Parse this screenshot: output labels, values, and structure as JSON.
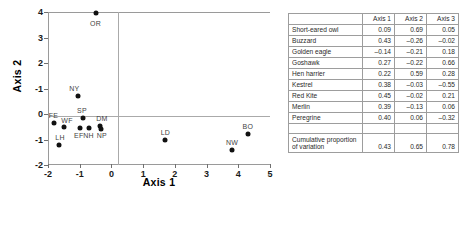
{
  "chart_data": {
    "type": "scatter",
    "title": "",
    "xlabel": "Axis 1",
    "ylabel": "Axis 2",
    "xlim": [
      -2,
      5
    ],
    "ylim": [
      -2,
      4
    ],
    "xticks": [
      "-2",
      "-1",
      "0",
      "1",
      "2",
      "3",
      "4",
      "5"
    ],
    "xtick_values": [
      -2,
      -1,
      0,
      1,
      2,
      3,
      4,
      5
    ],
    "yticks": [
      "4",
      "3",
      "2",
      "-1",
      "0",
      "-1",
      "-2"
    ],
    "ytick_values": [
      4,
      3,
      2,
      1,
      0,
      -1,
      -2
    ],
    "grid": false,
    "legend": "none",
    "points": [
      {
        "label": "OR",
        "x": -0.5,
        "y": 3.95,
        "lx": -0.5,
        "ly": 3.55
      },
      {
        "label": "NY",
        "x": -1.05,
        "y": 0.7,
        "lx": -1.17,
        "ly": 1.02
      },
      {
        "label": "SP",
        "x": -0.9,
        "y": -0.15,
        "lx": -0.93,
        "ly": 0.16
      },
      {
        "label": "FE",
        "x": -1.8,
        "y": -0.35,
        "lx": -1.83,
        "ly": -0.03
      },
      {
        "label": "WF",
        "x": -1.5,
        "y": -0.52,
        "lx": -1.4,
        "ly": -0.25
      },
      {
        "label": "EF",
        "x": -1.0,
        "y": -0.55,
        "lx": -1.03,
        "ly": -0.82
      },
      {
        "label": "NH",
        "x": -0.72,
        "y": -0.55,
        "lx": -0.72,
        "ly": -0.82
      },
      {
        "label": "DM",
        "x": -0.35,
        "y": -0.47,
        "lx": -0.3,
        "ly": -0.16
      },
      {
        "label": "NP",
        "x": -0.33,
        "y": -0.57,
        "lx": -0.3,
        "ly": -0.84
      },
      {
        "label": "LH",
        "x": -1.65,
        "y": -1.2,
        "lx": -1.62,
        "ly": -0.92
      },
      {
        "label": "LD",
        "x": 1.7,
        "y": -1.02,
        "lx": 1.7,
        "ly": -0.72
      },
      {
        "label": "NW",
        "x": 3.8,
        "y": -1.4,
        "lx": 3.8,
        "ly": -1.1
      },
      {
        "label": "BO",
        "x": 4.3,
        "y": -0.78,
        "lx": 4.3,
        "ly": -0.47
      }
    ]
  },
  "table": {
    "headers": [
      "",
      "Axis 1",
      "Axis 2",
      "Axis 3"
    ],
    "rows": [
      {
        "name": "Short-eared owl",
        "axis1": "0.09",
        "axis2": "0.69",
        "axis3": "0.05"
      },
      {
        "name": "Buzzard",
        "axis1": "0.43",
        "axis2": "–0.26",
        "axis3": "–0.02"
      },
      {
        "name": "Golden eagle",
        "axis1": "–0.14",
        "axis2": "–0.21",
        "axis3": "0.18"
      },
      {
        "name": "Goshawk",
        "axis1": "0.27",
        "axis2": "–0.22",
        "axis3": "0.66"
      },
      {
        "name": "Hen harrier",
        "axis1": "0.22",
        "axis2": "0.59",
        "axis3": "0.28"
      },
      {
        "name": "Kestrel",
        "axis1": "0.38",
        "axis2": "–0.03",
        "axis3": "–0.55"
      },
      {
        "name": "Red Kite",
        "axis1": "0.45",
        "axis2": "–0.02",
        "axis3": "0.21"
      },
      {
        "name": "Merlin",
        "axis1": "0.39",
        "axis2": "–0.13",
        "axis3": "0.06"
      },
      {
        "name": "Peregrine",
        "axis1": "0.40",
        "axis2": "0.06",
        "axis3": "–0.32"
      }
    ],
    "summary": {
      "name": "Cumulative proportion of variation",
      "axis1": "0.43",
      "axis2": "0.65",
      "axis3": "0.78"
    }
  },
  "colors": {
    "point": "#111111",
    "axis": "#9a9a9a",
    "text": "#1a1a1a",
    "table_border": "#9d9d9d"
  }
}
